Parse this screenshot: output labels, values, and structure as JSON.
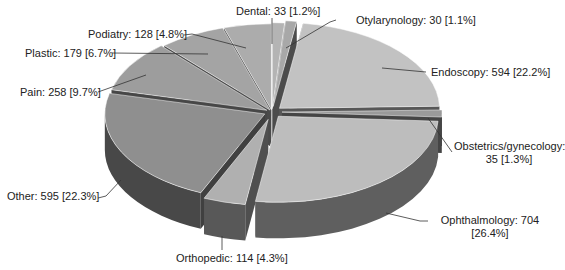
{
  "chart_data": {
    "type": "pie",
    "style": "3d-exploded",
    "title": "",
    "unit": "count [percent]",
    "start_angle_deg": 0,
    "direction": "clockwise",
    "slices": [
      {
        "label": "Dental",
        "value": 33,
        "percent": 1.2,
        "text": "Dental: 33 [1.2%]",
        "color": "#b4b4b4",
        "explode": 6
      },
      {
        "label": "Otylarynology",
        "value": 30,
        "percent": 1.1,
        "text": "Otylarynology: 30 [1.1%]",
        "color": "#a8a8a8",
        "explode": 10
      },
      {
        "label": "Endoscopy",
        "value": 594,
        "percent": 22.2,
        "text": "Endoscopy: 594 [22.2%]",
        "color": "#c2c2c2",
        "explode": 10
      },
      {
        "label": "Obstetrics/gynecology",
        "value": 35,
        "percent": 1.3,
        "text": "Obstetrics/gynecology:\n35 [1.3%]",
        "color": "#9a9a9a",
        "explode": 10
      },
      {
        "label": "Ophthalmology",
        "value": 704,
        "percent": 26.4,
        "text": "Ophthalmology: 704\n[26.4%]",
        "color": "#bdbdbd",
        "explode": 10
      },
      {
        "label": "Orthopedic",
        "value": 114,
        "percent": 4.3,
        "text": "Orthopedic: 114 [4.3%]",
        "color": "#b0b0b0",
        "explode": 14
      },
      {
        "label": "Other",
        "value": 595,
        "percent": 22.3,
        "text": "Other: 595 [22.3%]",
        "color": "#8f8f8f",
        "explode": 8
      },
      {
        "label": "Pain",
        "value": 258,
        "percent": 9.7,
        "text": "Pain: 258 [9.7%]",
        "color": "#9d9d9d",
        "explode": 6
      },
      {
        "label": "Plastic",
        "value": 179,
        "percent": 6.7,
        "text": "Plastic: 179 [6.7%]",
        "color": "#a4a4a4",
        "explode": 4
      },
      {
        "label": "Podiatry",
        "value": 128,
        "percent": 4.8,
        "text": "Podiatry: 128 [4.8%]",
        "color": "#acacac",
        "explode": 4
      }
    ],
    "total": 2670,
    "legend": "none (leader-line labels)"
  },
  "labels": {
    "dental": "Dental: 33 [1.2%]",
    "otylarynology": "Otylarynology: 30 [1.1%]",
    "endoscopy": "Endoscopy: 594 [22.2%]",
    "obstetrics_line1": "Obstetrics/gynecology:",
    "obstetrics_line2": "35 [1.3%]",
    "ophthalmology_line1": "Ophthalmology: 704",
    "ophthalmology_line2": "[26.4%]",
    "orthopedic": "Orthopedic: 114 [4.3%]",
    "other": "Other: 595 [22.3%]",
    "pain": "Pain: 258 [9.7%]",
    "plastic": "Plastic: 179 [6.7%]",
    "podiatry": "Podiatry: 128 [4.8%]"
  }
}
